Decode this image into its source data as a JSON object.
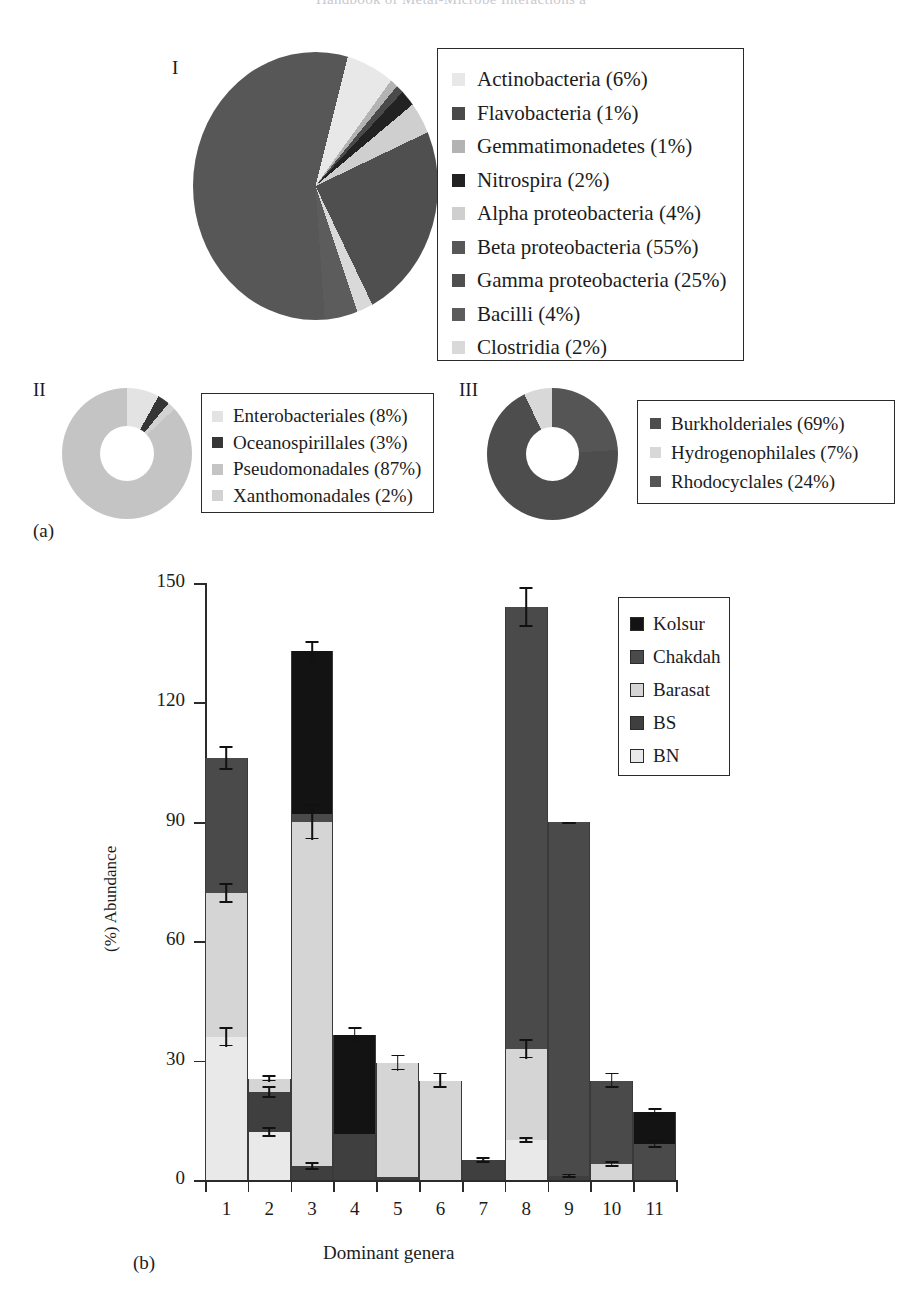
{
  "running_head": "Handbook of Metal-Microbe Interactions a",
  "panels": {
    "a_letter": "(a)",
    "b_letter": "(b)"
  },
  "pie_I": {
    "roman": "I",
    "type": "pie",
    "legend": [
      {
        "label": "Actinobacteria (6%)",
        "value": 6,
        "color": "#e8e8e8"
      },
      {
        "label": "Flavobacteria (1%)",
        "value": 1,
        "color": "#4a4a4a"
      },
      {
        "label": "Gemmatimonadetes (1%)",
        "value": 1,
        "color": "#b3b3b3"
      },
      {
        "label": "Nitrospira (2%)",
        "value": 2,
        "color": "#222222"
      },
      {
        "label": "Alpha proteobacteria (4%)",
        "value": 4,
        "color": "#cfcfcf"
      },
      {
        "label": "Beta proteobacteria (55%)",
        "value": 55,
        "color": "#575757"
      },
      {
        "label": "Gamma proteobacteria (25%)",
        "value": 25,
        "color": "#4f4f4f"
      },
      {
        "label": "Bacilli (4%)",
        "value": 4,
        "color": "#5c5c5c"
      },
      {
        "label": "Clostridia (2%)",
        "value": 2,
        "color": "#d9d9d9"
      }
    ]
  },
  "pie_II": {
    "roman": "II",
    "type": "pie",
    "legend": [
      {
        "label": "Enterobacteriales (8%)",
        "value": 8,
        "color": "#e3e3e3"
      },
      {
        "label": "Oceanospirillales (3%)",
        "value": 3,
        "color": "#363636"
      },
      {
        "label": "Pseudomonadales (87%)",
        "value": 87,
        "color": "#c4c4c4"
      },
      {
        "label": "Xanthomonadales (2%)",
        "value": 2,
        "color": "#d2d2d2"
      }
    ]
  },
  "pie_III": {
    "roman": "III",
    "type": "pie",
    "legend": [
      {
        "label": "Burkholderiales (69%)",
        "value": 69,
        "color": "#4d4d4d"
      },
      {
        "label": "Hydrogenophilales (7%)",
        "value": 7,
        "color": "#d8d8d8"
      },
      {
        "label": "Rhodocyclales (24%)",
        "value": 24,
        "color": "#555555"
      }
    ]
  },
  "chart_data": {
    "type": "bar",
    "subtype": "stacked-bar",
    "title": "",
    "xlabel": "Dominant genera",
    "ylabel": "(%) Abundance",
    "ylim": [
      0,
      150
    ],
    "yticks": [
      0,
      30,
      60,
      90,
      120,
      150
    ],
    "grid": false,
    "legend_position": "top-right",
    "categories": [
      "1",
      "2",
      "3",
      "4",
      "5",
      "6",
      "7",
      "8",
      "9",
      "10",
      "11"
    ],
    "series": [
      {
        "name": "BN",
        "color": "#e9e9e9",
        "values": [
          36,
          12,
          0,
          0,
          0,
          0,
          0,
          10,
          0,
          0,
          0
        ]
      },
      {
        "name": "BS",
        "color": "#3f3f3f",
        "values": [
          0,
          10,
          3.5,
          11.5,
          0.8,
          0,
          5,
          0,
          1,
          0,
          0
        ]
      },
      {
        "name": "Barasat",
        "color": "#d5d5d5",
        "values": [
          36,
          3.5,
          86.5,
          0,
          28.7,
          25,
          0,
          23,
          0,
          4,
          0
        ]
      },
      {
        "name": "Chakdah",
        "color": "#4a4a4a",
        "values": [
          34,
          0,
          2,
          0,
          0,
          0,
          0,
          111,
          89,
          21,
          9
        ]
      },
      {
        "name": "Kolsur",
        "color": "#131313",
        "values": [
          0,
          0,
          41,
          25,
          0,
          0,
          0,
          0,
          0,
          0,
          8
        ]
      }
    ],
    "totals": [
      106,
      25.5,
      133,
      36.5,
      29.5,
      25,
      5,
      144,
      90,
      25,
      17
    ],
    "stack_order": [
      "BN",
      "BS",
      "Barasat",
      "Chakdah",
      "Kolsur"
    ],
    "legend_order": [
      "Kolsur",
      "Chakdah",
      "Barasat",
      "BS",
      "BN"
    ],
    "error_bars": [
      {
        "category": "1",
        "markers": [
          {
            "y": 36,
            "err": 2.5
          },
          {
            "y": 72,
            "err": 2.5
          },
          {
            "y": 106,
            "err": 3
          }
        ]
      },
      {
        "category": "2",
        "markers": [
          {
            "y": 12,
            "err": 1.2
          },
          {
            "y": 22,
            "err": 1.5
          },
          {
            "y": 25.5,
            "err": 0.8
          }
        ]
      },
      {
        "category": "3",
        "markers": [
          {
            "y": 3.5,
            "err": 1
          },
          {
            "y": 90,
            "err": 4.5
          },
          {
            "y": 133,
            "err": 2.5
          }
        ]
      },
      {
        "category": "4",
        "markers": [
          {
            "y": 36.5,
            "err": 2
          }
        ]
      },
      {
        "category": "5",
        "markers": [
          {
            "y": 29.5,
            "err": 2
          }
        ]
      },
      {
        "category": "6",
        "markers": [
          {
            "y": 25,
            "err": 2
          }
        ]
      },
      {
        "category": "7",
        "markers": [
          {
            "y": 5,
            "err": 0.8
          }
        ]
      },
      {
        "category": "8",
        "markers": [
          {
            "y": 10,
            "err": 0.8
          },
          {
            "y": 33,
            "err": 2.5
          },
          {
            "y": 144,
            "err": 5
          }
        ]
      },
      {
        "category": "9",
        "markers": [
          {
            "y": 1,
            "err": 0.6
          },
          {
            "y": 90,
            "err": 0
          }
        ]
      },
      {
        "category": "10",
        "markers": [
          {
            "y": 4,
            "err": 0.8
          },
          {
            "y": 25,
            "err": 2
          }
        ]
      },
      {
        "category": "11",
        "markers": [
          {
            "y": 9,
            "err": 1
          },
          {
            "y": 17,
            "err": 1
          }
        ]
      }
    ]
  }
}
